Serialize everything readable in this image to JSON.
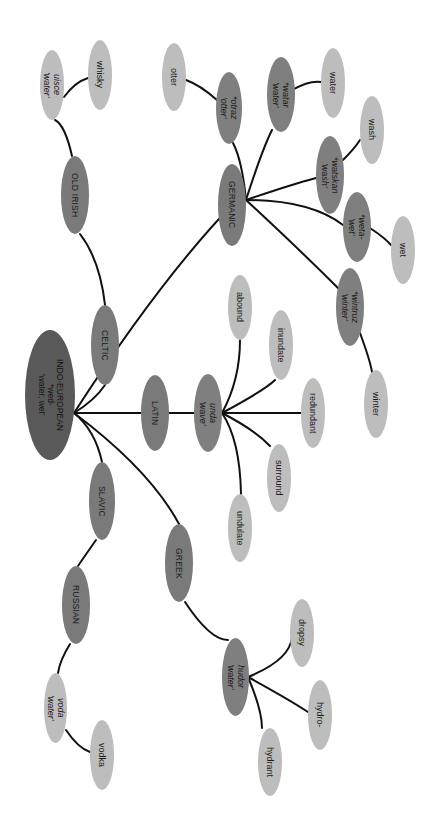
{
  "diagram": {
    "orientation": "rotated 90 degrees clockwise",
    "colors": {
      "root": "#595959",
      "branch": "#7a7a7a",
      "proto": "#7f7f7f",
      "leaf": "#bdbdbd",
      "edge": "#111111",
      "background": "#ffffff"
    },
    "root": {
      "label": "INDO-EUROPEAN\n*wed-\n'water, wet'"
    },
    "branches": {
      "celtic": {
        "label": "CELTIC"
      },
      "old_irish": {
        "label": "OLD IRISH"
      },
      "uisce": {
        "label": "uisce\n'water'"
      },
      "whisky": {
        "label": "whisky"
      },
      "latin": {
        "label": "LATIN"
      },
      "unda": {
        "label": "unda\n'wave'"
      },
      "abound": {
        "label": "abound"
      },
      "inundate": {
        "label": "inundate"
      },
      "redundant": {
        "label": "redundant"
      },
      "surround": {
        "label": "surround"
      },
      "undulate": {
        "label": "undulate"
      },
      "slavic": {
        "label": "SLAVIC"
      },
      "russian": {
        "label": "RUSSIAN"
      },
      "voda": {
        "label": "voda\n'water'"
      },
      "vodka": {
        "label": "vodka"
      },
      "greek": {
        "label": "GREEK"
      },
      "hudor": {
        "label": "hudor\n'water'"
      },
      "dropsy": {
        "label": "dropsy"
      },
      "hydro": {
        "label": "hydro-"
      },
      "hydrant": {
        "label": "hydrant"
      },
      "germanic": {
        "label": "GERMANIC"
      },
      "otraz": {
        "label": "*otraz\n'otter'"
      },
      "otter": {
        "label": "otter"
      },
      "watar": {
        "label": "*watar\n'water'"
      },
      "water": {
        "label": "water"
      },
      "watskan": {
        "label": "*watskan\n'wash'"
      },
      "wash": {
        "label": "wash"
      },
      "weta": {
        "label": "*weta-\n'wet'"
      },
      "wet": {
        "label": "wet"
      },
      "wintruz": {
        "label": "*wintruz\n'winter'"
      },
      "winter": {
        "label": "winter"
      }
    }
  }
}
